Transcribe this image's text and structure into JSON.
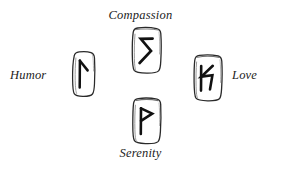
{
  "page": {
    "background_color": "#ffffff",
    "ink_color": "#1c1c1c",
    "layout": "cross",
    "title": ""
  },
  "runes": [
    {
      "id": "humor",
      "label": "Humor",
      "position": "left",
      "glyph_name": "rune-glyph-humor",
      "glyph_description": "vertical stroke with short diagonal branch from top descending to the right",
      "stone_name": "rune-stone-humor"
    },
    {
      "id": "compassion",
      "label": "Compassion",
      "position": "top",
      "glyph_name": "rune-glyph-compassion",
      "glyph_description": "angular zigzag S / lightning bolt stroke",
      "stone_name": "rune-stone-compassion"
    },
    {
      "id": "love",
      "label": "Love",
      "position": "right",
      "glyph_name": "rune-glyph-love",
      "glyph_description": "vertical stroke on the left with two diagonals forming an angular notch",
      "stone_name": "rune-stone-love"
    },
    {
      "id": "serenity",
      "label": "Serenity",
      "position": "bottom",
      "glyph_name": "rune-glyph-serenity",
      "glyph_description": "vertical stroke with triangular flag at the top, P shape",
      "stone_name": "rune-stone-serenity"
    }
  ]
}
